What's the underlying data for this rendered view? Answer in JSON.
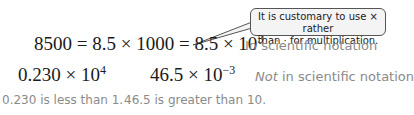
{
  "callout": {
    "line1": "It is customary to use × rather",
    "line2": "than · for multiplication."
  },
  "row1": {
    "expression_prefix": "8500 = 8.5 × 1000 = 8.5 × 10",
    "exponent": "3",
    "label": "In scientific notation"
  },
  "row2": {
    "expr1_base": "0.230 × 10",
    "expr1_exponent": "4",
    "expr2_base": "46.5 × 10",
    "expr2_exponent": "−3",
    "label_emphasis": "Not",
    "label_rest": " in scientific notation"
  },
  "row3": {
    "reason1": "0.230 is less than 1.",
    "reason2": "46.5 is greater than 10."
  }
}
